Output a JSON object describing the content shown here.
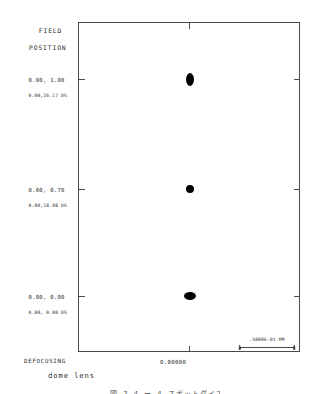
{
  "figure": {
    "heading": {
      "line1": "FIELD",
      "line2": "POSITION"
    },
    "defocus_label": "DEFOCUSING",
    "defocus_value": "0.00000",
    "lens_title": "dome lens",
    "scale_text": ".5000E-01 MM",
    "caption": "図 2.4 ー 4 スポットダイアグラム"
  },
  "chart_data": {
    "type": "scatter",
    "title": "dome lens",
    "subtitle": "DEFOCUSING  0.00000",
    "xlabel": "DEFOCUSING",
    "ylabel": "FIELD POSITION",
    "grid": false,
    "legend": "none",
    "xlim": [
      -1,
      1
    ],
    "x_ticks": [
      "0.00000"
    ],
    "scale_bar": {
      "length_label": ".5000E-01 MM",
      "value": 0.05,
      "units": "MM"
    },
    "series": [
      {
        "name": "0.00, 1.00",
        "field_relative": "0.00, 1.00",
        "field_angle": "0.00,26.17 DG",
        "x": 0.0,
        "y": 1.0,
        "spot_shape": "vertical-ellipse",
        "spot_width_px": 8,
        "spot_height_px": 13
      },
      {
        "name": "0.00, 0.70",
        "field_relative": "0.00, 0.70",
        "field_angle": "0.00,18.98 DG",
        "x": 0.0,
        "y": 0.7,
        "spot_shape": "round",
        "spot_width_px": 8,
        "spot_height_px": 8
      },
      {
        "name": "0.00, 0.00",
        "field_relative": "0.00, 0.00",
        "field_angle": "0.00, 0.00 DG",
        "x": 0.0,
        "y": 0.0,
        "spot_shape": "horizontal-ellipse",
        "spot_width_px": 12,
        "spot_height_px": 8
      }
    ],
    "field_positions": [
      {
        "relative": "0.00, 1.00",
        "angle": "0.00,26.17 DG"
      },
      {
        "relative": "0.00, 0.70",
        "angle": "0.00,18.98 DG"
      },
      {
        "relative": "0.00, 0.00",
        "angle": "0.00, 0.00 DG"
      }
    ]
  },
  "colors": {
    "spot": "#000000",
    "frame": "#4a4a4a",
    "text": "#2a2a2a",
    "background": "#ffffff"
  }
}
